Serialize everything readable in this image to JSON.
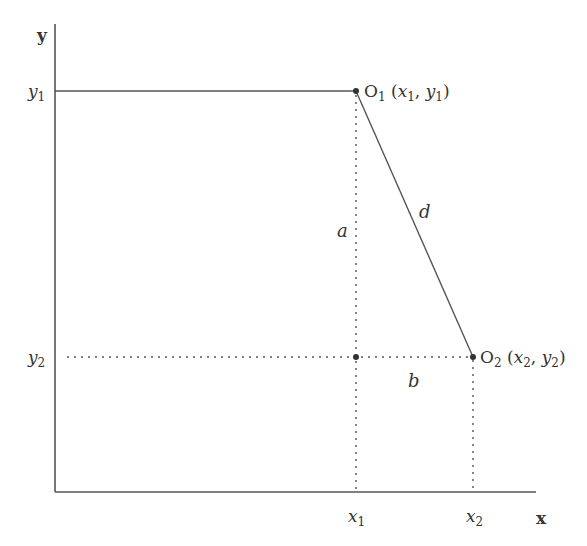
{
  "axes": {
    "x_label": "x",
    "y_label": "y"
  },
  "ticks": {
    "y1": {
      "base": "y",
      "sub": "1"
    },
    "y2": {
      "base": "y",
      "sub": "2"
    },
    "x1": {
      "base": "x",
      "sub": "1"
    },
    "x2": {
      "base": "x",
      "sub": "2"
    }
  },
  "points": {
    "o1": {
      "name": "O",
      "sub": "1",
      "coords_open": " (",
      "x": "x",
      "xs": "1",
      "comma": ", ",
      "y": "y",
      "ys": "1",
      "close": ")"
    },
    "o2": {
      "name": "O",
      "sub": "2",
      "coords_open": " (",
      "x": "x",
      "xs": "2",
      "comma": ", ",
      "y": "y",
      "ys": "2",
      "close": ")"
    }
  },
  "segments": {
    "a": "a",
    "b": "b",
    "d": "d"
  },
  "colors": {
    "line": "#555555",
    "text": "#333333"
  }
}
